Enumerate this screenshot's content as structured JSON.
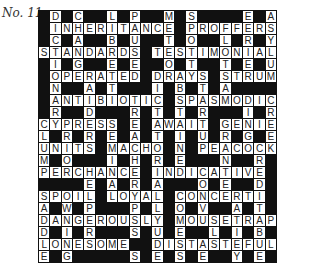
{
  "puzzle": {
    "title": "No. 11",
    "rows": 21,
    "cols": 21,
    "grid": [
      "#D#C##L#P##M#S####E#A",
      "#INHERITANCE#PROFFERS",
      "#C#A##B#U##T#O##L#R#Y",
      "STANDARDS#TESTIMONIAL",
      "#I#G##E#E##O#T##T#E#U",
      "#OPERATED#DRAYS#STRUM",
      "#N##A#T###I#B#T#A####",
      "#ANTIBIOTIC#SPASMODIC",
      "#R##D###R#T#T#R###I#R",
      "CYPRESS#E#AWAIT#GENIE",
      "L#R#R#E#A#T#I#U#R#G#E",
      "UNITS#MACHO#N#PEACOCK",
      "M#O###I#H#R#E###N##R#",
      "PERCHANCE#INDICATIVE#",
      "####E#A#R#A###O#E##D#",
      "SPOIL#LOYAL#CONCERTI#",
      "A#W#P###P#L#O#V##A#T#",
      "DANGEROUSLY#MOUSETRAP",
      "D#I#R###S#U#E##L#I#B#",
      "LONESOME##DISTASTEFUL",
      "E#G#####S#E#S#E##Y#E#"
    ],
    "across_words": [
      "INHERITANCE",
      "PROFFERS",
      "STANDARDS",
      "TESTIMONIAL",
      "OPERATED",
      "DRAYS",
      "STRUM",
      "ANTIBIOTIC",
      "SPASMODIC",
      "CYPRESS",
      "AWAIT",
      "GENIE",
      "UNITS",
      "MACHO",
      "PEACOCK",
      "PERCHANCE",
      "INDICATIVE",
      "SPOIL",
      "LOYAL",
      "CONCERTI",
      "DANGEROUSLY",
      "MOUSETRAP",
      "LONESOME",
      "DISTASTEFUL"
    ],
    "colors": {
      "black_cell": "#111111",
      "white_cell": "#ffffff",
      "letter": "#222222"
    }
  }
}
